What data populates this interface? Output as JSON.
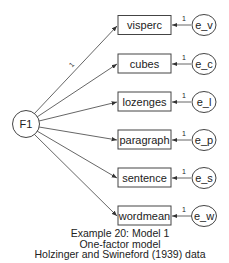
{
  "diagram": {
    "type": "path diagram",
    "factor": {
      "id": "F1",
      "label": "F1",
      "cx": 26,
      "cy": 124,
      "r": 13
    },
    "fixed_loading_label": "1",
    "indicators": [
      {
        "name": "visperc",
        "error": "e_v",
        "error_label": "e_v",
        "weight": "1",
        "y": 15
      },
      {
        "name": "cubes",
        "error": "e_c",
        "error_label": "e_c",
        "weight": "1",
        "y": 54
      },
      {
        "name": "lozenges",
        "error": "e_l",
        "error_label": "e_l",
        "weight": "1",
        "y": 92
      },
      {
        "name": "paragraph",
        "error": "e_p",
        "error_label": "e_p",
        "weight": "1",
        "y": 130
      },
      {
        "name": "sentence",
        "error": "e_s",
        "error_label": "e_s",
        "weight": "1",
        "y": 168
      },
      {
        "name": "wordmean",
        "error": "e_w",
        "error_label": "e_w",
        "weight": "1",
        "y": 206
      }
    ],
    "caption": {
      "line1": "Example 20: Model 1",
      "line2": "One-factor model",
      "line3": "Holzinger and Swineford (1939) data"
    },
    "colors": {
      "stroke": "#444444",
      "text": "#222222",
      "background": "#ffffff"
    }
  }
}
